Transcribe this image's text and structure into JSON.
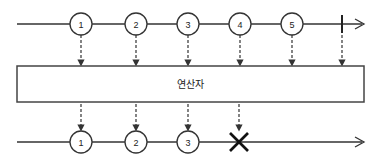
{
  "diagram": {
    "type": "marble-diagram",
    "colors": {
      "stroke": "#333333",
      "background": "#ffffff"
    },
    "input_stream": {
      "y": 24,
      "x_start": 17,
      "x_end": 364,
      "items": [
        {
          "label": "1",
          "x": 81
        },
        {
          "label": "2",
          "x": 136
        },
        {
          "label": "3",
          "x": 188
        },
        {
          "label": "4",
          "x": 240
        },
        {
          "label": "5",
          "x": 292
        }
      ],
      "completion_x": 342
    },
    "operator": {
      "label": "연산자",
      "box": {
        "x": 17,
        "y": 66,
        "width": 347,
        "height": 36
      }
    },
    "output_stream": {
      "y": 142,
      "x_start": 17,
      "x_end": 364,
      "items": [
        {
          "label": "1",
          "x": 81
        },
        {
          "label": "2",
          "x": 136
        },
        {
          "label": "3",
          "x": 188
        }
      ],
      "error_x": 239
    }
  }
}
